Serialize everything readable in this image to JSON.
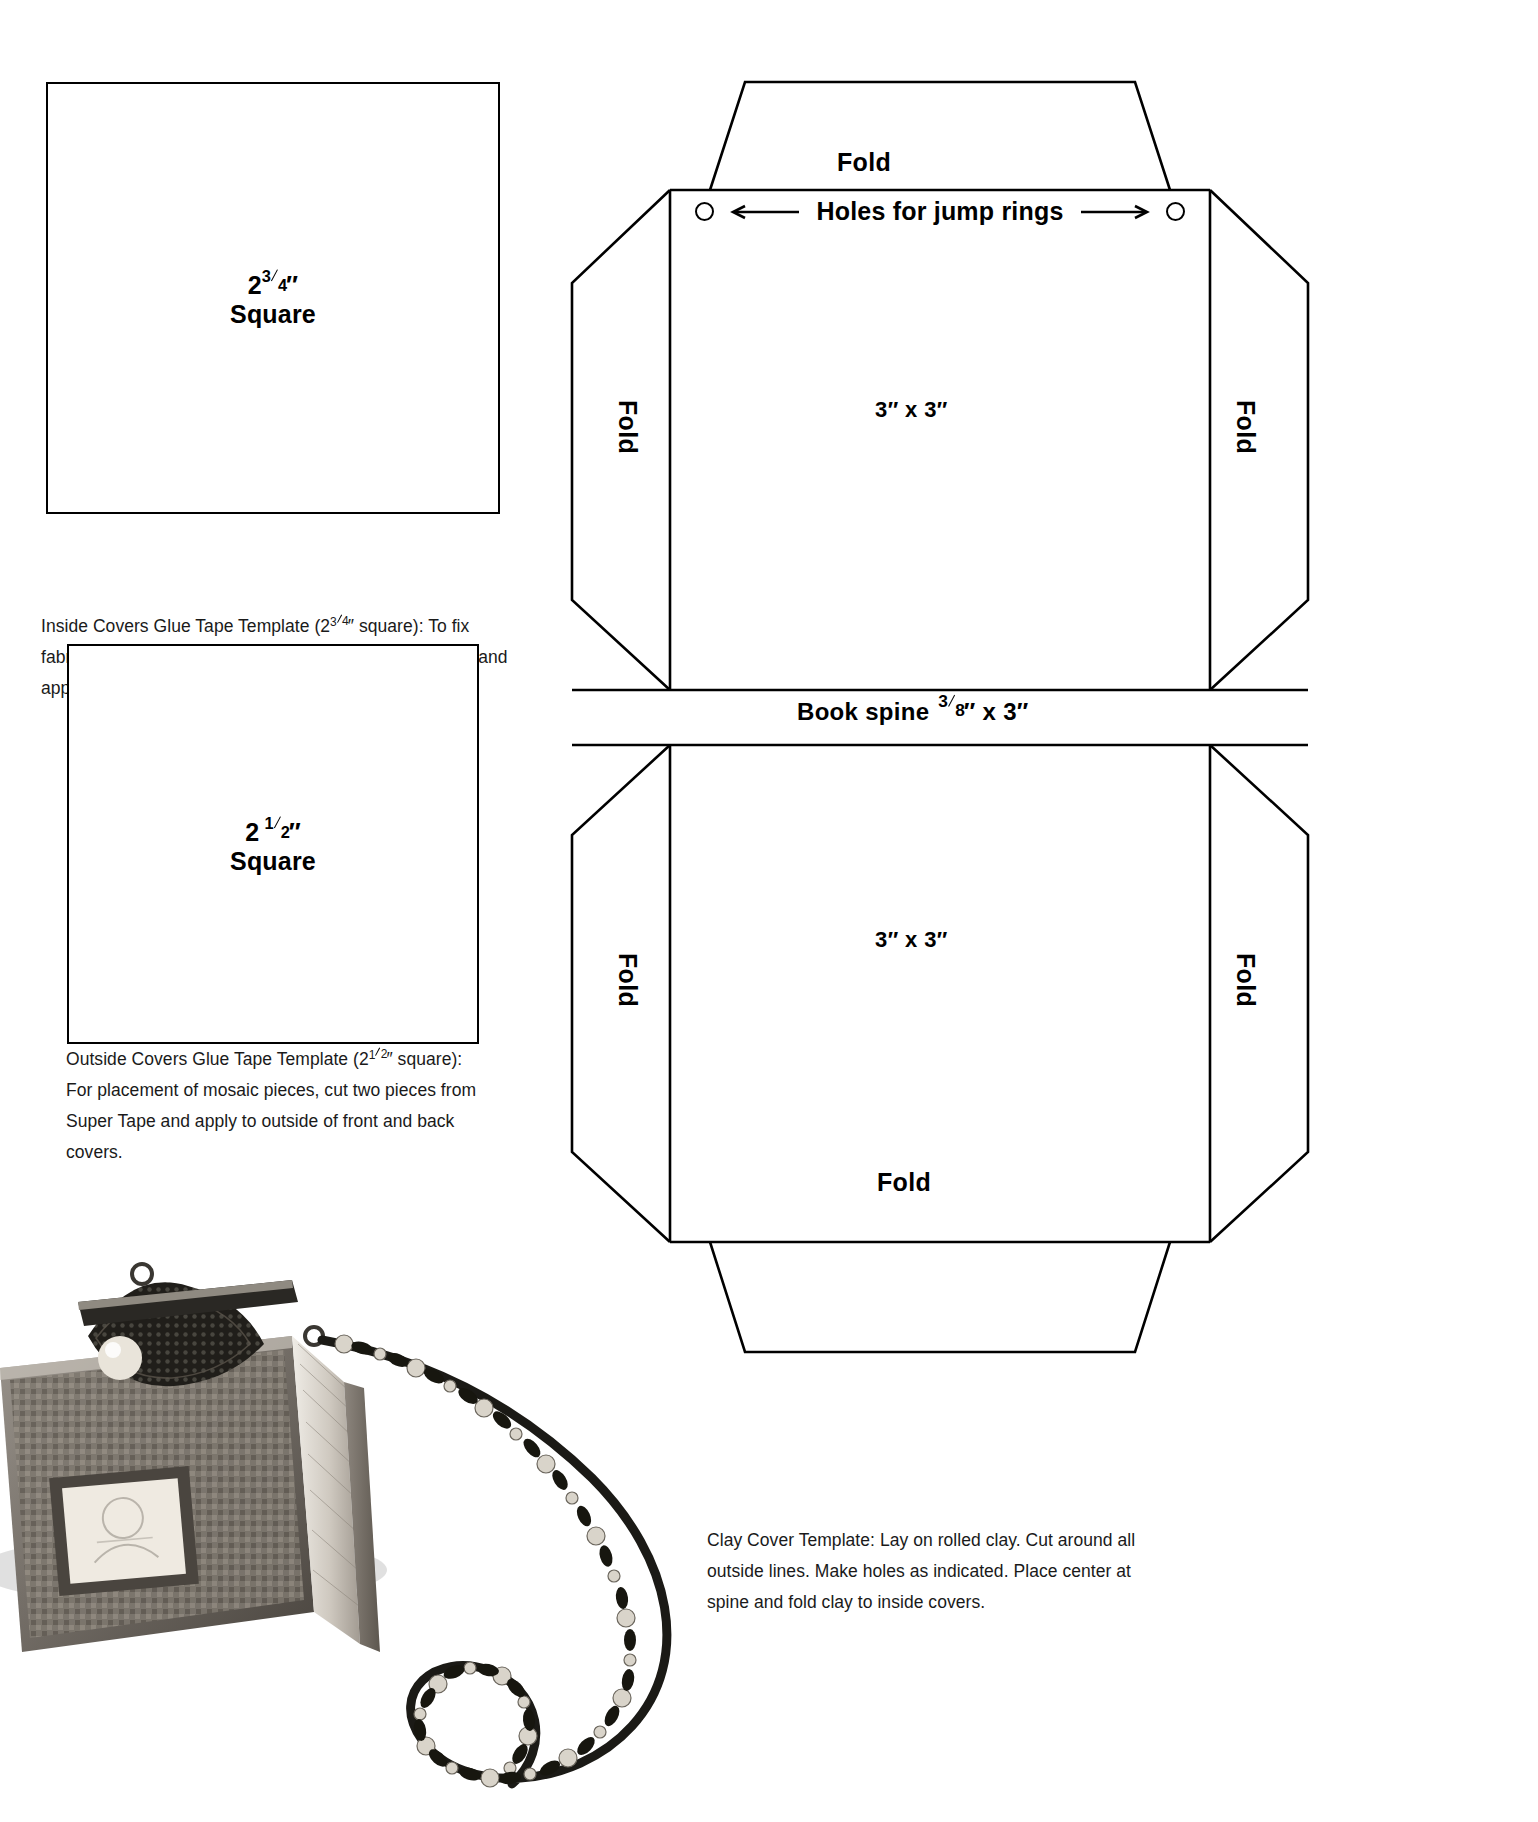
{
  "document": {
    "title": "Clay Cover Book Craft Templates",
    "ink_color": "#000000",
    "background_color": "#ffffff"
  },
  "inside_template": {
    "name": "Inside Covers Glue Tape Template",
    "dim_whole": "2",
    "dim_frac_num": "3",
    "dim_frac_den": "4",
    "dim_unit": "″",
    "shape_word": "Square",
    "caption_lead": "Inside Covers Glue Tape Template (2",
    "caption_frac_num": "3",
    "caption_frac_den": "4",
    "caption_rest": "″ square): To fix fabric pocket to covers, cut two pieces from Super Tape and apply to inside of front and back covers."
  },
  "outside_template": {
    "name": "Outside Covers Glue Tape Template",
    "dim_whole": "2",
    "dim_frac_num": "1",
    "dim_frac_den": "2",
    "dim_unit": "″",
    "shape_word": "Square",
    "caption_lead": "Outside Covers Glue Tape Template (2",
    "caption_frac_num": "1",
    "caption_frac_den": "2",
    "caption_rest": "″ square): For placement of mosaic pieces, cut two pieces from Super Tape and apply to outside of front and back covers."
  },
  "clay_template": {
    "fold_top": "Fold",
    "fold_bottom": "Fold",
    "fold_left_upper": "Fold",
    "fold_right_upper": "Fold",
    "fold_left_lower": "Fold",
    "fold_right_lower": "Fold",
    "holes_label": "Holes for jump rings",
    "panel_top_dim": "3″ x 3″",
    "panel_bottom_dim": "3″ x 3″",
    "spine_lead": "Book spine",
    "spine_frac_num": "3",
    "spine_frac_den": "8",
    "spine_rest": "″ x 3″",
    "caption": "Clay Cover Template: Lay on rolled clay. Cut around all outside lines. Make holes as indicated. Place center at spine and fold clay to inside covers."
  },
  "photo": {
    "alt": "Finished beaded mosaic mini book purse with chain strap"
  }
}
